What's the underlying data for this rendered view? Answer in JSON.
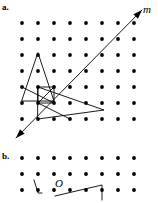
{
  "figure": {
    "background_color": "#ffffff",
    "ink_color": "#000000",
    "width": 158,
    "height": 203,
    "parts": [
      {
        "key": "a",
        "label": "a.",
        "label_x": 2,
        "label_y": 3,
        "description": "dot lattice with line m and reflected polygons"
      },
      {
        "key": "b",
        "label": "b.",
        "label_x": 2,
        "label_y": 152,
        "description": "dot lattice with point O and partial figure"
      }
    ],
    "annotations": [
      {
        "name": "line-label-m",
        "text": "m",
        "x": 143,
        "y": 4,
        "style": "italic"
      },
      {
        "name": "point-label-o",
        "text": "O",
        "x": 55,
        "y": 178,
        "style": "italic"
      }
    ]
  },
  "grid_a": {
    "dot_radius": 1.9,
    "x_start": 22,
    "x_step": 16.0,
    "cols": 8,
    "y_start": 23,
    "y_step": 16.0,
    "rows": 7
  },
  "grid_b": {
    "dot_radius": 1.9,
    "x_start": 22,
    "x_step": 16.0,
    "cols": 8,
    "y_start": 158,
    "y_step": 16.0,
    "rows": 3
  },
  "chart_data": {
    "type": "scatter",
    "title": "",
    "xlabel": "",
    "ylabel": "",
    "grid": true,
    "series": [
      {
        "name": "lattice-dots-a",
        "points": [
          [
            22,
            23
          ],
          [
            38,
            23
          ],
          [
            54,
            23
          ],
          [
            70,
            23
          ],
          [
            86,
            23
          ],
          [
            102,
            23
          ],
          [
            118,
            23
          ],
          [
            134,
            23
          ],
          [
            22,
            39
          ],
          [
            38,
            39
          ],
          [
            54,
            39
          ],
          [
            70,
            39
          ],
          [
            86,
            39
          ],
          [
            102,
            39
          ],
          [
            118,
            39
          ],
          [
            134,
            39
          ],
          [
            22,
            55
          ],
          [
            38,
            55
          ],
          [
            54,
            55
          ],
          [
            70,
            55
          ],
          [
            86,
            55
          ],
          [
            102,
            55
          ],
          [
            118,
            55
          ],
          [
            134,
            55
          ],
          [
            22,
            71
          ],
          [
            38,
            71
          ],
          [
            54,
            71
          ],
          [
            70,
            71
          ],
          [
            86,
            71
          ],
          [
            102,
            71
          ],
          [
            118,
            71
          ],
          [
            134,
            71
          ],
          [
            22,
            87
          ],
          [
            38,
            87
          ],
          [
            54,
            87
          ],
          [
            70,
            87
          ],
          [
            86,
            87
          ],
          [
            102,
            87
          ],
          [
            118,
            87
          ],
          [
            134,
            87
          ],
          [
            22,
            103
          ],
          [
            38,
            103
          ],
          [
            54,
            103
          ],
          [
            70,
            103
          ],
          [
            86,
            103
          ],
          [
            102,
            103
          ],
          [
            118,
            103
          ],
          [
            134,
            103
          ],
          [
            22,
            119
          ],
          [
            38,
            119
          ],
          [
            54,
            119
          ],
          [
            70,
            119
          ],
          [
            86,
            119
          ],
          [
            102,
            119
          ],
          [
            118,
            119
          ],
          [
            134,
            119
          ]
        ]
      },
      {
        "name": "lattice-dots-b",
        "points": [
          [
            22,
            158
          ],
          [
            38,
            158
          ],
          [
            54,
            158
          ],
          [
            70,
            158
          ],
          [
            86,
            158
          ],
          [
            102,
            158
          ],
          [
            118,
            158
          ],
          [
            134,
            158
          ],
          [
            22,
            174
          ],
          [
            38,
            174
          ],
          [
            54,
            174
          ],
          [
            70,
            174
          ],
          [
            86,
            174
          ],
          [
            102,
            174
          ],
          [
            118,
            174
          ],
          [
            134,
            174
          ],
          [
            22,
            190
          ],
          [
            38,
            190
          ],
          [
            54,
            190
          ],
          [
            70,
            190
          ],
          [
            86,
            190
          ],
          [
            102,
            190
          ],
          [
            118,
            190
          ],
          [
            134,
            190
          ]
        ]
      }
    ],
    "lines": [
      {
        "name": "line-m",
        "kind": "double-arrow",
        "from": [
          16,
          138
        ],
        "to": [
          142,
          10
        ]
      },
      {
        "name": "tall-triangle",
        "kind": "polygon",
        "points": [
          [
            38,
            53
          ],
          [
            54,
            101
          ],
          [
            22,
            101
          ]
        ]
      },
      {
        "name": "wide-triangle",
        "kind": "polygon",
        "points": [
          [
            38,
            103
          ],
          [
            104,
            110
          ],
          [
            38,
            103
          ]
        ]
      },
      {
        "name": "inner-quadrilateral",
        "kind": "polygon",
        "points": [
          [
            38,
            103
          ],
          [
            38,
            87
          ],
          [
            54,
            87
          ],
          [
            54,
            103
          ]
        ]
      },
      {
        "name": "figure-b-caret",
        "kind": "polyline",
        "points": [
          [
            34,
            180
          ],
          [
            38,
            193
          ],
          [
            42,
            193
          ]
        ]
      },
      {
        "name": "figure-b-segment",
        "kind": "polyline",
        "points": [
          [
            55,
            196
          ],
          [
            102,
            185
          ],
          [
            102,
            200
          ]
        ]
      }
    ]
  }
}
